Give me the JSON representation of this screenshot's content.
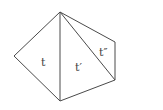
{
  "diagram": {
    "labels": {
      "t": "t",
      "t_prime": "t′",
      "t_double_prime": "t″"
    },
    "vertices": {
      "top": [
        60,
        12
      ],
      "left": [
        14,
        56
      ],
      "bottom": [
        60,
        101
      ],
      "right_bottom": [
        115,
        80
      ],
      "right_top": [
        115,
        42
      ]
    },
    "stroke_color": "#4a4a4a"
  }
}
